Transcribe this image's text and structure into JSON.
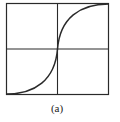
{
  "figure": {
    "caption": "(a)",
    "colors": {
      "line": "#2a2a2a",
      "background": "#ffffff"
    }
  }
}
